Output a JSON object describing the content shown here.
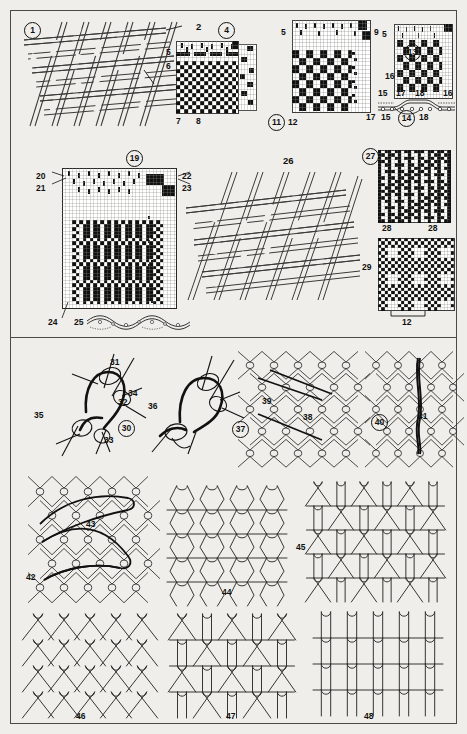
{
  "plate": {
    "title": "Textile structures plate",
    "background_color": "#efeeea",
    "ink_color": "#111111",
    "border_color": "#4a4a46",
    "width": 467,
    "height": 734
  },
  "sections": [
    {
      "name": "woven-fabrics",
      "description": "Figures 1-29: woven fabric drawings and point-paper weave diagrams"
    },
    {
      "name": "knitted-fabrics",
      "description": "Figures 30-48: knitted and net loop structure diagrams"
    }
  ],
  "figures": [
    {
      "id": "fig-1",
      "circled": true,
      "number": "1"
    },
    {
      "id": "fig-4",
      "circled": true,
      "number": "4"
    },
    {
      "id": "fig-11",
      "circled": true,
      "number": "11"
    },
    {
      "id": "fig-13",
      "circled": true,
      "number": "13"
    },
    {
      "id": "fig-14",
      "circled": true,
      "number": "14"
    },
    {
      "id": "fig-19",
      "circled": true,
      "number": "19"
    },
    {
      "id": "fig-27",
      "circled": true,
      "number": "27"
    },
    {
      "id": "fig-30",
      "circled": true,
      "number": "30"
    },
    {
      "id": "fig-37",
      "circled": true,
      "number": "37"
    },
    {
      "id": "fig-40",
      "circled": true,
      "number": "40"
    },
    {
      "id": "fig-26",
      "circled": false,
      "number": "26"
    },
    {
      "id": "fig-29",
      "circled": false,
      "number": "29"
    },
    {
      "id": "fig-36",
      "circled": false,
      "number": "36"
    },
    {
      "id": "fig-42",
      "circled": false,
      "number": "42"
    },
    {
      "id": "fig-44",
      "circled": false,
      "number": "44"
    },
    {
      "id": "fig-45",
      "circled": false,
      "number": "45"
    },
    {
      "id": "fig-46",
      "circled": false,
      "number": "46"
    },
    {
      "id": "fig-47",
      "circled": false,
      "number": "47"
    },
    {
      "id": "fig-48",
      "circled": false,
      "number": "48"
    }
  ],
  "callouts": {
    "fig1": {
      "a": "2",
      "b": "3"
    },
    "fig4": {
      "a": "5",
      "b": "6",
      "c": "7",
      "d": "8",
      "e": "9",
      "f": "10"
    },
    "fig11": {
      "a": "5",
      "b": "9",
      "c": "12"
    },
    "fig13": {
      "a": "5",
      "b": "9",
      "c": "16",
      "d": "15",
      "e": "17",
      "f": "18"
    },
    "fig14": {
      "a": "16",
      "b": "17",
      "c": "15",
      "d": "18"
    },
    "fig19": {
      "a": "20",
      "b": "21",
      "c": "22",
      "d": "23",
      "e": "24",
      "f": "25"
    },
    "fig27": {
      "a": "28",
      "b": "28"
    },
    "fig29": {
      "a": "12"
    },
    "fig30": {
      "a": "31",
      "b": "32",
      "c": "33",
      "d": "34",
      "e": "35"
    },
    "fig37": {
      "a": "38",
      "b": "39"
    },
    "fig40": {
      "a": "41"
    },
    "fig42": {
      "a": "43"
    }
  },
  "labels": {
    "n1": "1",
    "n2": "2",
    "n3": "3",
    "n4": "4",
    "n5": "5",
    "n6": "6",
    "n7": "7",
    "n8": "8",
    "n9": "9",
    "n10": "10",
    "n11": "11",
    "n12": "12",
    "n13": "13",
    "n14": "14",
    "n15": "15",
    "n16": "16",
    "n17": "17",
    "n18": "18",
    "n19": "19",
    "n20": "20",
    "n21": "21",
    "n22": "22",
    "n23": "23",
    "n24": "24",
    "n25": "25",
    "n26": "26",
    "n27": "27",
    "n28": "28",
    "n29": "29",
    "n30": "30",
    "n31": "31",
    "n32": "32",
    "n33": "33",
    "n34": "34",
    "n35": "35",
    "n36": "36",
    "n37": "37",
    "n38": "38",
    "n39": "39",
    "n40": "40",
    "n41": "41",
    "n42": "42",
    "n43": "43",
    "n44": "44",
    "n45": "45",
    "n46": "46",
    "n47": "47",
    "n48": "48"
  },
  "weave_grids": {
    "fig4": {
      "cols": 16,
      "rows": 19,
      "cell": 3.4,
      "name": "point-paper-diagram-4"
    },
    "fig11": {
      "cols": 22,
      "rows": 24,
      "cell": 3.3,
      "name": "point-paper-diagram-11"
    },
    "fig13": {
      "cols": 19,
      "rows": 20,
      "cell": 3.2,
      "name": "point-paper-diagram-13"
    },
    "fig19": {
      "cols": 32,
      "rows": 38,
      "cell": 3.5,
      "name": "point-paper-diagram-19"
    },
    "fig27": {
      "cols": 22,
      "rows": 24,
      "cell": 3.3,
      "name": "point-paper-diagram-27"
    },
    "fig29": {
      "cols": 24,
      "rows": 22,
      "cell": 3.3,
      "name": "point-paper-diagram-29"
    },
    "fig9": {
      "cols": 6,
      "rows": 22,
      "cell": 3.3,
      "name": "point-paper-strip-9"
    }
  }
}
